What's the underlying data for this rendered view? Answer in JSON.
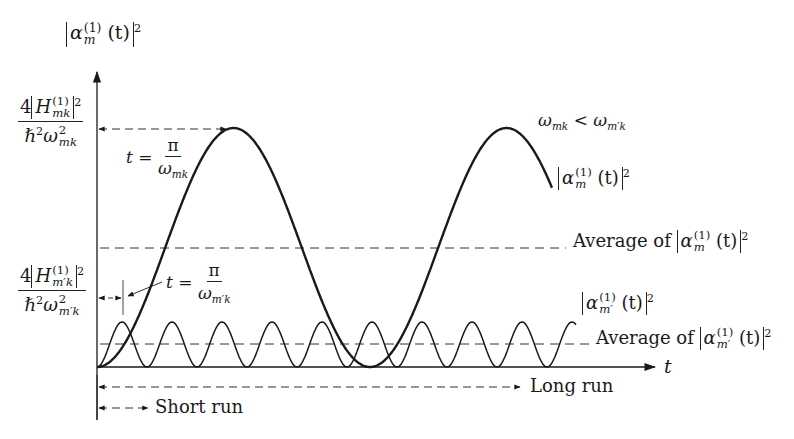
{
  "figure": {
    "y_axis_label": {
      "func": "α",
      "sub": "m",
      "sup": "(1)",
      "arg": "(t)",
      "power": "2"
    },
    "x_axis_label": "t",
    "y_tick_top": {
      "numerator_coeff": "4",
      "H": "H",
      "H_sub": "mk",
      "H_sup": "(1)",
      "power": "2",
      "den_hbar": "ℏ",
      "den_hbar_pow": "2",
      "den_omega": "ω",
      "den_omega_sub": "mk",
      "den_omega_pow": "2"
    },
    "y_tick_lower": {
      "numerator_coeff": "4",
      "H": "H",
      "H_sub": "m′k",
      "H_sup": "(1)",
      "power": "2",
      "den_hbar": "ℏ",
      "den_hbar_pow": "2",
      "den_omega": "ω",
      "den_omega_sub": "m′k",
      "den_omega_pow": "2"
    },
    "annotation_period_mk": {
      "lhs": "t =",
      "num": "π",
      "den_omega": "ω",
      "den_sub": "mk"
    },
    "annotation_period_mpk": {
      "lhs": "t =",
      "num": "π",
      "den_omega": "ω",
      "den_sub": "m′k"
    },
    "condition": {
      "left": "ω",
      "left_sub": "mk",
      "op": "<",
      "right": "ω",
      "right_sub": "m′k"
    },
    "curve_label_m": {
      "func": "α",
      "sub": "m",
      "sup": "(1)",
      "arg": "(t)",
      "power": "2"
    },
    "curve_label_mp": {
      "func": "α",
      "sub": "m′",
      "sup": "(1)",
      "arg": "(t)",
      "power": "2"
    },
    "average_m": {
      "text": "Average of",
      "func": "α",
      "sub": "m",
      "sup": "(1)",
      "arg": "(t)",
      "power": "2"
    },
    "average_mp": {
      "text": "Average of",
      "func": "α",
      "sub": "m′",
      "sup": "(1)",
      "arg": "(t)",
      "power": "2"
    },
    "long_run_label": "Long run",
    "short_run_label": "Short run"
  },
  "colors": {
    "ink": "#1a1a1a",
    "background": "#ffffff"
  },
  "geometry": {
    "origin": [
      97,
      367
    ],
    "slow_curve": {
      "amplitude_px": 239,
      "period_px": 273,
      "end_x": 552
    },
    "fast_curve": {
      "amplitude_px": 45,
      "period_px": 50,
      "end_x": 576
    },
    "avg_slow_y": 248,
    "avg_fast_y": 344
  }
}
